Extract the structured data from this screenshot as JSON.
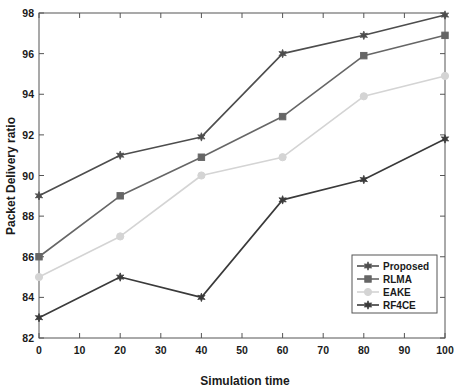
{
  "chart_data": {
    "type": "line",
    "title": "",
    "xlabel": "Simulation time",
    "ylabel": "Packet Delivery ratio",
    "xlim": [
      0,
      100
    ],
    "ylim": [
      82,
      98
    ],
    "xticks": [
      0,
      10,
      20,
      30,
      40,
      50,
      60,
      70,
      80,
      90,
      100
    ],
    "yticks": [
      82,
      84,
      86,
      88,
      90,
      92,
      94,
      96,
      98
    ],
    "grid": false,
    "legend_position": "lower right",
    "x": [
      0,
      20,
      40,
      60,
      80,
      100
    ],
    "series": [
      {
        "name": "Proposed",
        "values": [
          89.0,
          91.0,
          91.9,
          96.0,
          96.9,
          97.9
        ],
        "color": "#4d4d4d",
        "marker": "star-diamond"
      },
      {
        "name": "RLMA",
        "values": [
          86.0,
          89.0,
          90.9,
          92.9,
          95.9,
          96.9
        ],
        "color": "#666666",
        "marker": "square"
      },
      {
        "name": "EAKE",
        "values": [
          85.0,
          87.0,
          90.0,
          90.9,
          93.9,
          94.9
        ],
        "color": "#d4d4d4",
        "marker": "circle"
      },
      {
        "name": "RF4CE",
        "values": [
          83.0,
          85.0,
          84.0,
          88.8,
          89.8,
          91.8
        ],
        "color": "#3a3a3a",
        "marker": "star-diamond"
      }
    ]
  },
  "legend": {
    "items": [
      {
        "label": "Proposed"
      },
      {
        "label": "RLMA"
      },
      {
        "label": "EAKE"
      },
      {
        "label": "RF4CE"
      }
    ]
  },
  "axes": {
    "x_title": "Simulation time",
    "y_title": "Packet Delivery ratio",
    "x_tick_labels": [
      "0",
      "10",
      "20",
      "30",
      "40",
      "50",
      "60",
      "70",
      "80",
      "90",
      "100"
    ],
    "y_tick_labels": [
      "82",
      "84",
      "86",
      "88",
      "90",
      "92",
      "94",
      "96",
      "98"
    ]
  }
}
